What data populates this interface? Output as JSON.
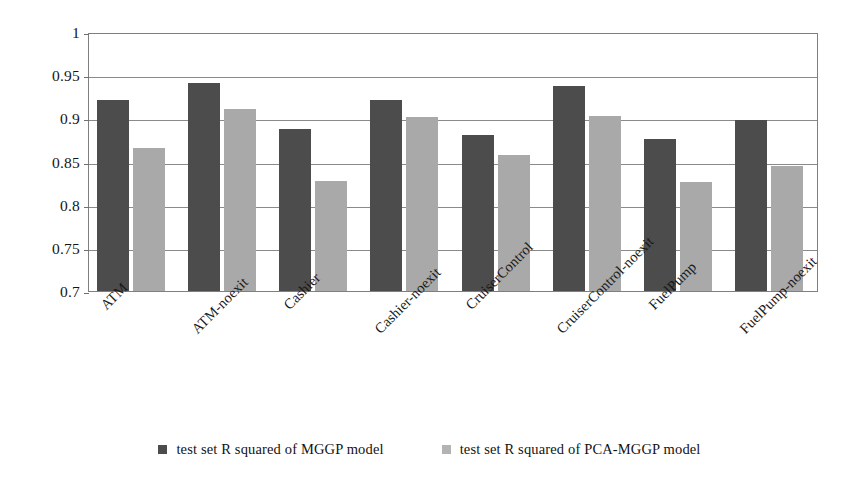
{
  "chart_data": {
    "type": "bar",
    "title": "",
    "subtitle": "",
    "xlabel": "",
    "ylabel": "",
    "ylim": [
      0.7,
      1
    ],
    "grid": true,
    "legend_position": "bottom",
    "y_ticks": [
      "1",
      "0.95",
      "0.9",
      "0.85",
      "0.8",
      "0.75",
      "0.7"
    ],
    "y_tick_values": [
      1,
      0.95,
      0.9,
      0.85,
      0.8,
      0.75,
      0.7
    ],
    "categories": [
      "ATM",
      "ATM-noexit",
      "Cashier",
      "Cashier-noexit",
      "CruiserControl",
      "CruiserControl-noexit",
      "FuelPump",
      "FuelPump-noexit"
    ],
    "series": [
      {
        "name": "test set R squared of MGGP model",
        "color": "#4c4c4c",
        "values": [
          0.921,
          0.941,
          0.888,
          0.921,
          0.881,
          0.938,
          0.876,
          0.898
        ]
      },
      {
        "name": "test set R squared of PCA-MGGP model",
        "color": "#a9a9a9",
        "values": [
          0.866,
          0.911,
          0.827,
          0.901,
          0.858,
          0.903,
          0.826,
          0.845
        ]
      }
    ]
  },
  "legend": {
    "items": [
      {
        "label": "test set R squared of MGGP model",
        "swatch": "legend-swatch-dark"
      },
      {
        "label": "test set R squared of PCA-MGGP model",
        "swatch": "legend-swatch-light"
      }
    ]
  }
}
